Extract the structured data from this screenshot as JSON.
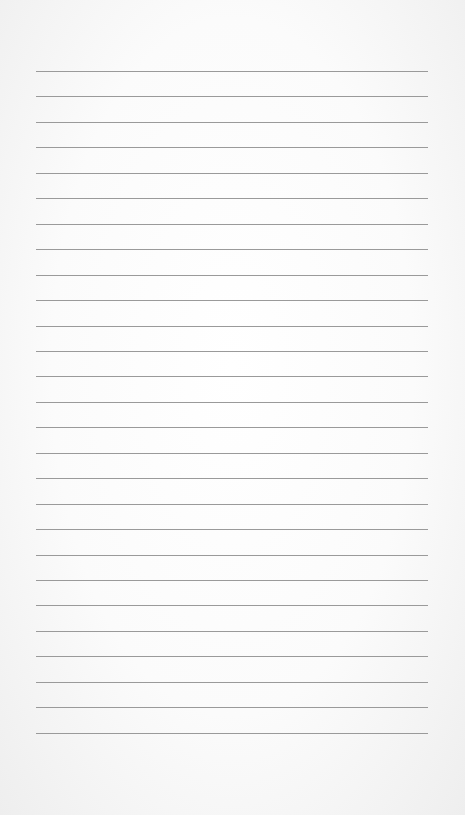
{
  "paper": {
    "type": "lined-notebook-page",
    "line_count": 27,
    "first_line_y": 71,
    "line_spacing": 25.45,
    "line_left": 36,
    "line_width": 392,
    "line_color": "#9a9a9a",
    "background_color": "#fbfbfb"
  }
}
